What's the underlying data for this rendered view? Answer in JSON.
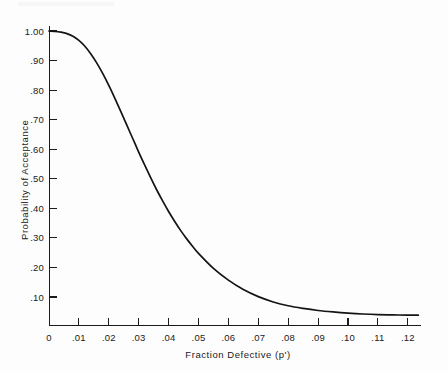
{
  "figure": {
    "background_color": "#fdfdfd",
    "ink_color": "#1b1b1b"
  },
  "chart_data": {
    "type": "line",
    "title": "",
    "subtitle": "",
    "xlabel": "Fraction Defective (p')",
    "ylabel": "Probability of Acceptance",
    "xlim": [
      0,
      0.1285
    ],
    "ylim": [
      0,
      1.0
    ],
    "grid": false,
    "legend": null,
    "xticks": [
      0,
      0.01,
      0.02,
      0.03,
      0.04,
      0.05,
      0.06,
      0.07,
      0.08,
      0.09,
      0.1,
      0.11,
      0.12
    ],
    "xticklabels": [
      "0",
      ".01",
      ".02",
      ".03",
      ".04",
      ".05",
      ".06",
      ".07",
      ".08",
      ".09",
      ".10",
      ".11",
      ".12"
    ],
    "yticks": [
      0.1,
      0.2,
      0.3,
      0.4,
      0.5,
      0.6,
      0.7,
      0.8,
      0.9,
      1.0
    ],
    "yticklabels": [
      ".10",
      ".20",
      ".30",
      ".40",
      ".50",
      ".60",
      ".70",
      ".80",
      ".90",
      "1.00"
    ],
    "y_origin_label": "0",
    "series": [
      {
        "name": "OC curve",
        "x": [
          0.0,
          0.002,
          0.004,
          0.006,
          0.008,
          0.01,
          0.012,
          0.014,
          0.016,
          0.018,
          0.02,
          0.022,
          0.024,
          0.026,
          0.028,
          0.03,
          0.032,
          0.034,
          0.036,
          0.038,
          0.04,
          0.042,
          0.044,
          0.046,
          0.048,
          0.05,
          0.055,
          0.06,
          0.065,
          0.07,
          0.075,
          0.08,
          0.085,
          0.09,
          0.095,
          0.1,
          0.105,
          0.11,
          0.115,
          0.12,
          0.1235
        ],
        "y": [
          1.0,
          0.999,
          0.996,
          0.991,
          0.982,
          0.968,
          0.948,
          0.922,
          0.891,
          0.855,
          0.815,
          0.772,
          0.727,
          0.681,
          0.635,
          0.589,
          0.545,
          0.502,
          0.461,
          0.423,
          0.387,
          0.354,
          0.323,
          0.295,
          0.269,
          0.245,
          0.194,
          0.154,
          0.122,
          0.098,
          0.08,
          0.067,
          0.058,
          0.051,
          0.046,
          0.042,
          0.039,
          0.037,
          0.036,
          0.035,
          0.035
        ]
      }
    ]
  }
}
